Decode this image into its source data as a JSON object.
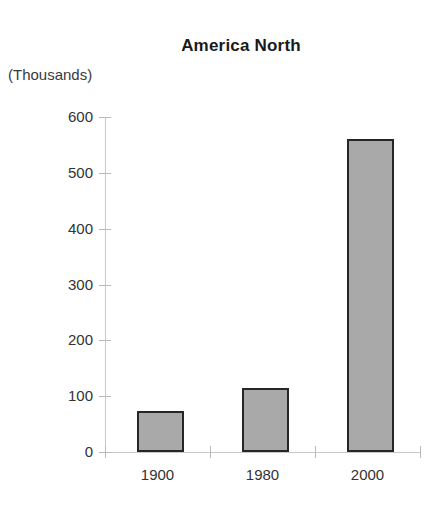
{
  "chart_data": {
    "type": "bar",
    "title": "America North",
    "xlabel": "",
    "ylabel": "(Thousands)",
    "categories": [
      "1900",
      "1980",
      "2000"
    ],
    "values": [
      73,
      115,
      560
    ],
    "series": [
      {
        "name": "America North",
        "values": [
          73,
          115,
          560
        ]
      }
    ],
    "ylim": [
      0,
      600
    ],
    "ytick_labels": [
      "600",
      "500",
      "400",
      "300",
      "200",
      "100",
      "0"
    ],
    "ytick_values": [
      600,
      500,
      400,
      300,
      200,
      100,
      0
    ],
    "grid": false,
    "legend": false,
    "legend_position": "none",
    "colors": {
      "bar_fill": "#a9a9a9",
      "bar_border": "#262626",
      "axis": "#c9c9c9",
      "text": "#333333",
      "title": "#1a1a1a",
      "background": "#ffffff"
    }
  }
}
